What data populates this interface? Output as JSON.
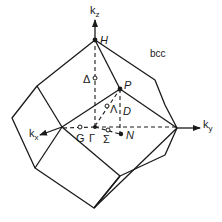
{
  "figure": {
    "title": "bcc",
    "line_color": "#1a1a1a",
    "axes": {
      "kx": {
        "base": "k",
        "sub": "x"
      },
      "ky": {
        "base": "k",
        "sub": "y"
      },
      "kz": {
        "base": "k",
        "sub": "z"
      }
    },
    "points": {
      "H": "H",
      "P": "P",
      "N": "N",
      "Gamma": "Γ"
    },
    "lines": {
      "Delta": "Δ",
      "Lambda": "Λ",
      "Sigma": "Σ",
      "D": "D",
      "G": "G"
    }
  }
}
